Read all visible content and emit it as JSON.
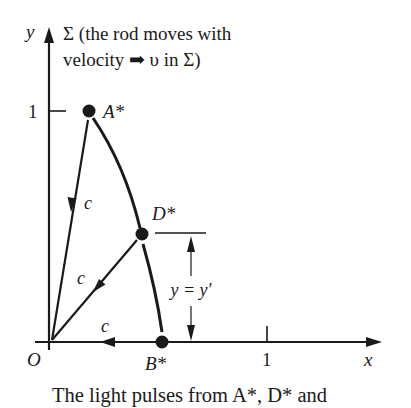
{
  "title": {
    "line1": "Σ (the rod moves with",
    "line2": "velocity ➡ υ in Σ)"
  },
  "axes": {
    "y_label": "y",
    "x_label": "x",
    "origin_label": "O",
    "y_tick_label": "1",
    "x_tick_label": "1"
  },
  "points": {
    "a": "A*",
    "d": "D*",
    "b": "B*"
  },
  "rays": {
    "from_a": "c",
    "from_d": "c",
    "from_b": "c"
  },
  "dimension": {
    "label": "y = y′"
  },
  "caption": "The light pulses from A*, D* and",
  "colors": {
    "ink": "#1a1a1a",
    "background": "#ffffff"
  }
}
